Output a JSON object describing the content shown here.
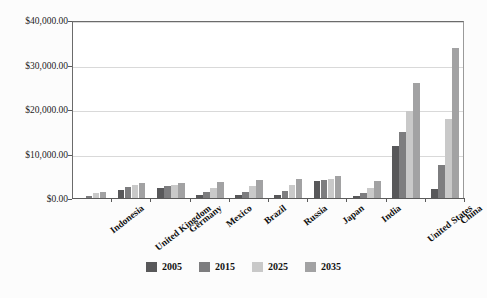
{
  "chart_data": {
    "type": "bar",
    "title": "",
    "subtitle": "",
    "xlabel": "",
    "ylabel": "",
    "ylim": [
      0,
      40000
    ],
    "grid": true,
    "legend_position": "bottom",
    "ytick_labels": [
      "$0.00",
      "$10,000.00",
      "$20,000.00",
      "$30,000.00",
      "$40,000.00"
    ],
    "ytick_values": [
      0,
      10000,
      20000,
      30000,
      40000
    ],
    "categories": [
      "Indonesia",
      "United Kingdom",
      "Germany",
      "Mexico",
      "Brazil",
      "Russia",
      "Japan",
      "India",
      "United States",
      "China"
    ],
    "series": [
      {
        "name": "2005",
        "color": "#58585a",
        "values": [
          300,
          2100,
          2500,
          900,
          900,
          800,
          4000,
          700,
          12000,
          2200
        ]
      },
      {
        "name": "2015",
        "color": "#7d7d7f",
        "values": [
          700,
          2600,
          2900,
          1500,
          1600,
          1700,
          4200,
          1300,
          15000,
          7600
        ]
      },
      {
        "name": "2025",
        "color": "#c9c9c9",
        "values": [
          1400,
          3200,
          3100,
          2400,
          2900,
          3200,
          4600,
          2400,
          19800,
          18000
        ]
      },
      {
        "name": "2035",
        "color": "#a2a2a3",
        "values": [
          1600,
          3500,
          3500,
          3900,
          4200,
          4500,
          5100,
          4000,
          26000,
          34000
        ]
      }
    ]
  }
}
